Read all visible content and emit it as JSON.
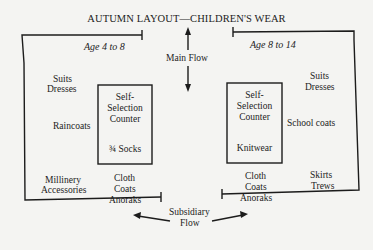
{
  "title": "AUTUMN LAYOUT—CHILDREN'S WEAR",
  "left_zone": {
    "age_label": "Age 4 to 8",
    "items": {
      "suits": "Suits",
      "dresses": "Dresses",
      "raincoats": "Raincoats",
      "millinery": "Millinery",
      "accessories": "Accessories",
      "cloth": "Cloth",
      "coats": "Coats",
      "anoraks": "Anoraks"
    },
    "counter": {
      "line1": "Self-",
      "line2": "Selection",
      "line3": "Counter",
      "product": "¾ Socks"
    }
  },
  "right_zone": {
    "age_label": "Age 8 to 14",
    "items": {
      "suits": "Suits",
      "dresses": "Dresses",
      "school_coats": "School coats",
      "skirts": "Skirts",
      "trews": "Trews",
      "cloth": "Cloth",
      "coats": "Coats",
      "anoraks": "Anoraks"
    },
    "counter": {
      "line1": "Self-",
      "line2": "Selection",
      "line3": "Counter",
      "product": "Knitwear"
    }
  },
  "flows": {
    "main": "Main Flow",
    "subsidiary_line1": "Subsidiary",
    "subsidiary_line2": "Flow"
  }
}
